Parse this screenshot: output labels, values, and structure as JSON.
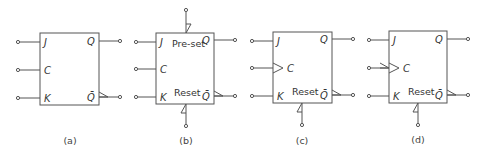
{
  "figure": {
    "diagrams": [
      {
        "id": "a",
        "caption": "(a)",
        "inputs": {
          "j": "J",
          "c": "C",
          "k": "K"
        },
        "outputs": {
          "q": "Q",
          "qbar": "Q̄"
        },
        "preset": null,
        "reset": null,
        "clock": "level"
      },
      {
        "id": "b",
        "caption": "(b)",
        "inputs": {
          "j": "J",
          "c": "C",
          "k": "K"
        },
        "outputs": {
          "q": "Q",
          "qbar": "Q̄"
        },
        "preset": "Pre-set",
        "reset": "Reset",
        "clock": "level"
      },
      {
        "id": "c",
        "caption": "(c)",
        "inputs": {
          "j": "J",
          "c": "C",
          "k": "K"
        },
        "outputs": {
          "q": "Q",
          "qbar": "Q̄"
        },
        "preset": null,
        "reset": "Reset",
        "clock": "rising-edge"
      },
      {
        "id": "d",
        "caption": "(d)",
        "inputs": {
          "j": "J",
          "c": "C",
          "k": "K"
        },
        "outputs": {
          "q": "Q",
          "qbar": "Q̄"
        },
        "preset": null,
        "reset": "Reset",
        "clock": "falling-edge"
      }
    ],
    "colors": {
      "stroke": "#555555",
      "text": "#333333",
      "background": "#ffffff"
    }
  }
}
